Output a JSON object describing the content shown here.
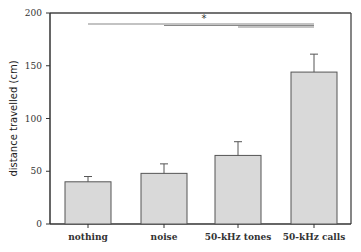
{
  "chart_data": {
    "type": "bar",
    "title": "",
    "xlabel": "",
    "ylabel": "distance travelled (cm)",
    "categories": [
      "nothing",
      "noise",
      "50-kHz tones",
      "50-kHz calls"
    ],
    "values": [
      40,
      48,
      65,
      144
    ],
    "error_plus": [
      5,
      9,
      13,
      17
    ],
    "ylim": [
      0,
      200
    ],
    "yticks": [
      0,
      50,
      100,
      150,
      200
    ],
    "grid": false,
    "legend": null,
    "bar_color": "#d9d9d9",
    "annotations": [
      {
        "type": "significance",
        "label": "*",
        "from": "nothing",
        "to": "50-kHz calls"
      },
      {
        "type": "significance",
        "label": "",
        "from": "noise",
        "to": "50-kHz calls"
      },
      {
        "type": "significance",
        "label": "",
        "from": "50-kHz tones",
        "to": "50-kHz calls"
      }
    ]
  }
}
